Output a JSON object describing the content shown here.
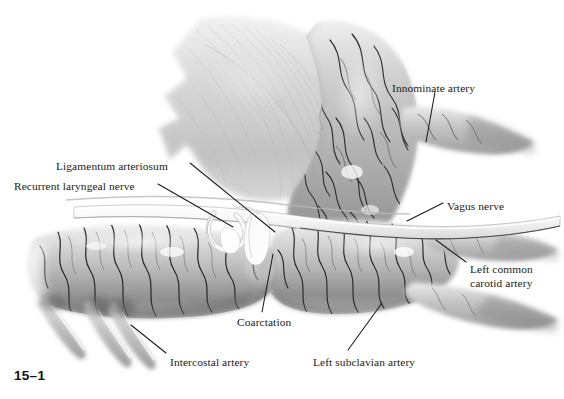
{
  "figure": {
    "number": "15–1",
    "background_color": "#ffffff",
    "ink_color": "#1a1a1a",
    "width": 564,
    "height": 399
  },
  "labels": [
    {
      "id": "innominate-artery",
      "text": "Innominate artery",
      "x": 392,
      "y": 82,
      "lines": [
        "Innominate artery"
      ]
    },
    {
      "id": "ligamentum-arteriosum",
      "text": "Ligamentum arteriosum",
      "x": 56,
      "y": 160,
      "lines": [
        "Ligamentum arteriosum"
      ]
    },
    {
      "id": "recurrent-laryngeal-nerve",
      "text": "Recurrent laryngeal nerve",
      "x": 14,
      "y": 180,
      "lines": [
        "Recurrent laryngeal nerve"
      ]
    },
    {
      "id": "vagus-nerve",
      "text": "Vagus nerve",
      "x": 447,
      "y": 200,
      "lines": [
        "Vagus nerve"
      ]
    },
    {
      "id": "left-common-carotid-artery",
      "text": "Left common carotid artery",
      "x": 470,
      "y": 263,
      "lines": [
        "Left common",
        "carotid artery"
      ]
    },
    {
      "id": "coarctation",
      "text": "Coarctation",
      "x": 237,
      "y": 316,
      "lines": [
        "Coarctation"
      ]
    },
    {
      "id": "intercostal-artery",
      "text": "Intercostal artery",
      "x": 170,
      "y": 356,
      "lines": [
        "Intercostal artery"
      ]
    },
    {
      "id": "left-subclavian-artery",
      "text": "Left subclavian artery",
      "x": 313,
      "y": 356,
      "lines": [
        "Left subclavian artery"
      ]
    }
  ],
  "leader_lines": [
    {
      "id": "innominate-artery-leader",
      "x1": 435,
      "y1": 92,
      "x2": 426,
      "y2": 142
    },
    {
      "id": "ligamentum-arteriosum-leader",
      "x1": 190,
      "y1": 163,
      "x2": 275,
      "y2": 232
    },
    {
      "id": "recurrent-laryngeal-leader",
      "x1": 158,
      "y1": 184,
      "x2": 233,
      "y2": 227
    },
    {
      "id": "vagus-nerve-leader",
      "x1": 443,
      "y1": 203,
      "x2": 407,
      "y2": 221
    },
    {
      "id": "left-common-carotid-leader",
      "x1": 466,
      "y1": 262,
      "x2": 436,
      "y2": 240
    },
    {
      "id": "coarctation-leader",
      "x1": 273,
      "y1": 254,
      "x2": 262,
      "y2": 312
    },
    {
      "id": "intercostal-artery-leader",
      "x1": 166,
      "y1": 353,
      "x2": 131,
      "y2": 325
    },
    {
      "id": "left-subclavian-leader",
      "x1": 348,
      "y1": 350,
      "x2": 382,
      "y2": 303
    }
  ],
  "anatomy": {
    "structures": [
      {
        "id": "lung-pleura-flap",
        "name": "Lung / pleural flap"
      },
      {
        "id": "aortic-arch",
        "name": "Aortic arch"
      },
      {
        "id": "ascending-aorta",
        "name": "Ascending aorta"
      },
      {
        "id": "innominate-artery-vessel",
        "name": "Innominate artery"
      },
      {
        "id": "left-common-carotid-vessel",
        "name": "Left common carotid artery"
      },
      {
        "id": "left-subclavian-vessel",
        "name": "Left subclavian artery"
      },
      {
        "id": "descending-aorta",
        "name": "Descending aorta"
      },
      {
        "id": "coarctation-narrowing",
        "name": "Coarctation narrowing"
      },
      {
        "id": "ligamentum-arteriosum-band",
        "name": "Ligamentum arteriosum"
      },
      {
        "id": "vagus-nerve-trunk",
        "name": "Vagus nerve"
      },
      {
        "id": "recurrent-laryngeal-loop",
        "name": "Recurrent laryngeal nerve loop"
      },
      {
        "id": "intercostal-branch-1",
        "name": "Intercostal artery"
      },
      {
        "id": "intercostal-branch-2",
        "name": "Intercostal artery"
      },
      {
        "id": "intercostal-branch-3",
        "name": "Intercostal artery"
      }
    ],
    "palette": {
      "tissue_light": "#e9e9e9",
      "tissue_mid": "#c9c9c9",
      "tissue_dark": "#9b9b9b",
      "tissue_shadow": "#7a7a7a",
      "vessel_line": "#4a4a4a",
      "nerve_pale": "#f3f3f3"
    }
  }
}
